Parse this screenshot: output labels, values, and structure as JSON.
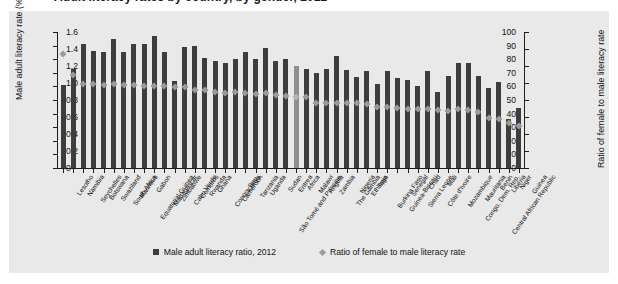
{
  "figure": {
    "title_cut": "Adult literacy rates by country, by gender, 2012",
    "background": "#e9e9e9",
    "bar_color": "#3d3d3d",
    "marker_color": "#9a9a9a",
    "highlight_color": "#8f8f8f"
  },
  "legend": {
    "items": [
      {
        "label": "Male adult literacy ratio, 2012",
        "marker": "square-swatch"
      },
      {
        "label": "Ratio of female to male literacy rate",
        "marker": "diamond-swatch"
      }
    ]
  },
  "chart_data": {
    "type": "bar",
    "title": "",
    "xlabel": "",
    "ylabel": "Male adult literacy rate (%)",
    "y2label": "Ratio of female to male literacy rate",
    "ylim": [
      0,
      100
    ],
    "y2lim": [
      0,
      1.6
    ],
    "yticks": [
      "0",
      "10",
      "20",
      "30",
      "40",
      "50",
      "60",
      "70",
      "80",
      "90",
      "100"
    ],
    "y2ticks": [
      "0",
      "0.2",
      "0.4",
      "0.6",
      "0.8",
      "1.0",
      "1.2",
      "1.4",
      "1.6"
    ],
    "grid": false,
    "legend_position": "bottom",
    "categories": [
      "Lesotho",
      "Namibia",
      "Seychelles",
      "Botswana",
      "Swaziland",
      "South Africa",
      "Mauritius",
      "Equatorial Guinea",
      "Gabon",
      "Madagascar",
      "Zimbabwe",
      "Cabo Verde",
      "Comoros",
      "Rwanda",
      "Ghana",
      "Congo, Rep.",
      "Cameroon",
      "Kenya",
      "Tanzania",
      "Uganda",
      "São Tomé and Príncipe",
      "Sudan",
      "Eritrea",
      "Africa",
      "Malawi",
      "Angola",
      "Zambia",
      "The Gambia",
      "Nigeria",
      "Ethiopia",
      "Togo",
      "Burkina Faso",
      "Guinea-Bissau",
      "Senegal",
      "Sierra Leone",
      "Chad",
      "Côte d'Ivoire",
      "Mali",
      "Mozambique",
      "Congo, Dem. Rep.",
      "Mauritania",
      "Central African Republic",
      "Benin",
      "Liberia",
      "Niger",
      "Guinea"
    ],
    "series": [
      {
        "name": "Male adult literacy ratio, 2012",
        "axis": "left",
        "values": [
          61,
          73,
          91,
          86,
          85,
          95,
          85,
          91,
          91,
          97,
          85,
          64,
          89,
          90,
          81,
          79,
          77,
          80,
          85,
          80,
          88,
          79,
          80,
          75,
          73,
          70,
          73,
          82,
          72,
          67,
          71,
          62,
          71,
          66,
          65,
          60,
          71,
          56,
          68,
          77,
          77,
          68,
          59,
          63,
          36,
          44
        ]
      },
      {
        "name": "Ratio of female to male literacy rate",
        "axis": "right",
        "values": [
          1.34,
          1.1,
          0.99,
          0.99,
          0.98,
          0.99,
          0.98,
          0.98,
          0.97,
          0.97,
          0.97,
          0.95,
          0.95,
          0.92,
          0.92,
          0.9,
          0.88,
          0.89,
          0.88,
          0.87,
          0.88,
          0.86,
          0.85,
          0.84,
          0.84,
          0.77,
          0.77,
          0.76,
          0.77,
          0.76,
          0.75,
          0.72,
          0.72,
          0.71,
          0.69,
          0.7,
          0.7,
          0.68,
          0.67,
          0.69,
          0.68,
          0.66,
          0.59,
          0.58,
          0.53,
          0.5
        ]
      }
    ],
    "highlight_category": "Africa"
  }
}
